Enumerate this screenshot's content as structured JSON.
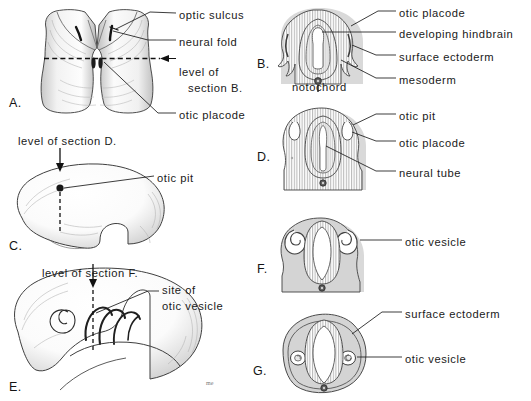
{
  "figure": {
    "width": 531,
    "height": 401,
    "background": "#ffffff",
    "ink": "#1a1a1a",
    "tissue_fill": "#d6d6d6",
    "lumen_fill": "#ffffff",
    "notochord_fill": "#5a5a5a"
  },
  "panels": [
    {
      "id": "A",
      "letter": "A.",
      "caption": "Dorsal view of neural folds and otic placode"
    },
    {
      "id": "B",
      "letter": "B.",
      "caption": "Transverse section at level of section B."
    },
    {
      "id": "C",
      "letter": "C.",
      "caption": "Lateral view of embryo showing otic pit"
    },
    {
      "id": "D",
      "letter": "D.",
      "caption": "Transverse section at level of section D."
    },
    {
      "id": "E",
      "letter": "E.",
      "caption": "Lateral view of older embryo, site of otic vesicle"
    },
    {
      "id": "F",
      "letter": "F.",
      "caption": "Transverse section at level of section F."
    },
    {
      "id": "G",
      "letter": "G.",
      "caption": "Transverse section showing closed otic vesicles"
    }
  ],
  "labels": {
    "panel_a": [
      {
        "text": "optic sulcus",
        "x": 179,
        "y": 9
      },
      {
        "text": "neural fold",
        "x": 179,
        "y": 36
      },
      {
        "text": "level of",
        "x": 179,
        "y": 66
      },
      {
        "text": "section B.",
        "x": 188,
        "y": 82
      },
      {
        "text": "otic placode",
        "x": 179,
        "y": 109
      }
    ],
    "panel_b": [
      {
        "text": "otic placode",
        "x": 399,
        "y": 7
      },
      {
        "text": "developing hindbrain",
        "x": 399,
        "y": 28
      },
      {
        "text": "surface ectoderm",
        "x": 399,
        "y": 51
      },
      {
        "text": "mesoderm",
        "x": 399,
        "y": 74
      },
      {
        "text": "notochord",
        "x": 292,
        "y": 81
      }
    ],
    "panel_c": [
      {
        "text": "level of section D.",
        "x": 18,
        "y": 135
      },
      {
        "text": "otic pit",
        "x": 157,
        "y": 172
      }
    ],
    "panel_d": [
      {
        "text": "otic pit",
        "x": 399,
        "y": 110
      },
      {
        "text": "otic placode",
        "x": 399,
        "y": 137
      },
      {
        "text": "neural tube",
        "x": 399,
        "y": 167
      }
    ],
    "panel_e": [
      {
        "text": "level of section F.",
        "x": 42,
        "y": 267
      },
      {
        "text": "site of",
        "x": 162,
        "y": 284
      },
      {
        "text": "otic vesicle",
        "x": 162,
        "y": 300
      }
    ],
    "panel_f": [
      {
        "text": "otic vesicle",
        "x": 405,
        "y": 236
      }
    ],
    "panel_g": [
      {
        "text": "surface ectoderm",
        "x": 405,
        "y": 308
      },
      {
        "text": "otic vesicle",
        "x": 405,
        "y": 353
      }
    ]
  },
  "panel_letters": [
    {
      "id": "letter-a",
      "text": "A.",
      "x": 9,
      "y": 96
    },
    {
      "id": "letter-b",
      "text": "B.",
      "x": 257,
      "y": 57
    },
    {
      "id": "letter-c",
      "text": "C.",
      "x": 9,
      "y": 239
    },
    {
      "id": "letter-d",
      "text": "D.",
      "x": 257,
      "y": 150
    },
    {
      "id": "letter-e",
      "text": "E.",
      "x": 9,
      "y": 380
    },
    {
      "id": "letter-f",
      "text": "F.",
      "x": 257,
      "y": 262
    },
    {
      "id": "letter-g",
      "text": "G.",
      "x": 253,
      "y": 364
    }
  ],
  "artist_signature": {
    "text": "me",
    "x": 206,
    "y": 380
  }
}
